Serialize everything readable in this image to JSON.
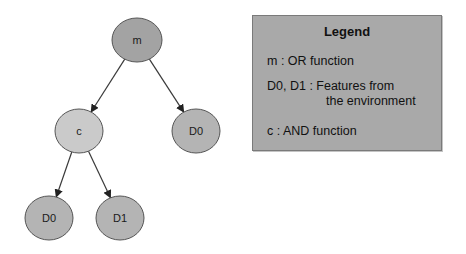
{
  "diagram": {
    "type": "tree",
    "nodes": [
      {
        "id": "m",
        "label": "m",
        "cx": 137,
        "cy": 40,
        "rx": 25,
        "ry": 22,
        "fill": "#a3a3a3"
      },
      {
        "id": "c",
        "label": "c",
        "cx": 79,
        "cy": 131,
        "rx": 24,
        "ry": 22,
        "fill": "#cacaca"
      },
      {
        "id": "d0_right",
        "label": "D0",
        "cx": 196,
        "cy": 131,
        "rx": 24,
        "ry": 22,
        "fill": "#b4b4b4"
      },
      {
        "id": "d0_left",
        "label": "D0",
        "cx": 49,
        "cy": 218,
        "rx": 24,
        "ry": 22,
        "fill": "#b4b4b4"
      },
      {
        "id": "d1",
        "label": "D1",
        "cx": 120,
        "cy": 218,
        "rx": 24,
        "ry": 22,
        "fill": "#b4b4b4"
      }
    ],
    "edges": [
      {
        "from": "m",
        "to": "c"
      },
      {
        "from": "m",
        "to": "d0_right"
      },
      {
        "from": "c",
        "to": "d0_left"
      },
      {
        "from": "c",
        "to": "d1"
      }
    ]
  },
  "legend": {
    "title": "Legend",
    "entries": [
      {
        "key": "m",
        "separator": " : ",
        "description": "OR function"
      },
      {
        "key": "D0, D1",
        "separator": " : ",
        "description": "Features from",
        "description_cont": "the environment"
      },
      {
        "key": "c",
        "separator": " :  ",
        "description": "AND function"
      }
    ]
  },
  "colors": {
    "background": "#ffffff",
    "edge": "#3a3a3a",
    "node_stroke": "#555555",
    "legend_fill": "#a9a9a9"
  }
}
